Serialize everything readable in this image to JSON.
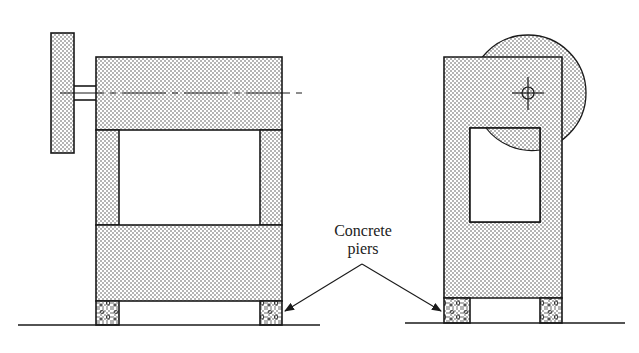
{
  "figure": {
    "label_line1": "Concrete",
    "label_line2": "piers",
    "colors": {
      "ink": "#1a1a1a",
      "stipple_dot": "#555555",
      "background": "#ffffff"
    }
  },
  "views": [
    {
      "name": "front-view",
      "parts": [
        "flywheel",
        "shaft",
        "centerline",
        "upper-housing",
        "left-column",
        "right-column",
        "base-block",
        "left-pier",
        "right-pier",
        "ground-line"
      ]
    },
    {
      "name": "side-view",
      "parts": [
        "flywheel-disc",
        "frame",
        "window-opening",
        "shaft-center-mark",
        "left-pier",
        "right-pier",
        "ground-line"
      ]
    }
  ]
}
